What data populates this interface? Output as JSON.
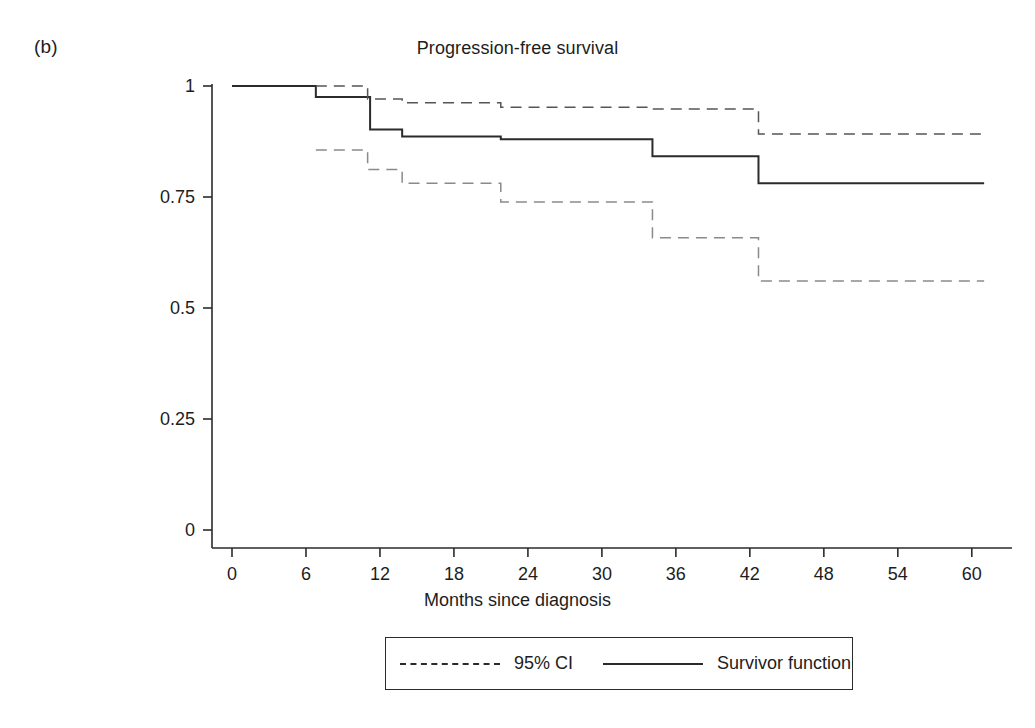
{
  "panel": {
    "label": "(b)"
  },
  "chart_data": {
    "type": "line",
    "subtype": "kaplan-meier-step",
    "title": "Progression-free survival",
    "xlabel": "Months since diagnosis",
    "ylabel": "",
    "xlim": [
      0,
      61.5
    ],
    "ylim": [
      0,
      1
    ],
    "grid": false,
    "xticks": [
      0,
      6,
      12,
      18,
      24,
      30,
      36,
      42,
      48,
      54,
      60
    ],
    "xtick_labels": [
      "0",
      "6",
      "12",
      "18",
      "24",
      "30",
      "36",
      "42",
      "48",
      "54",
      "60"
    ],
    "yticks": [
      0,
      0.25,
      0.5,
      0.75,
      1
    ],
    "ytick_labels": [
      "0",
      "0.25",
      "0.5",
      "0.75",
      "1"
    ],
    "legend": {
      "position": "below-axes",
      "entries": [
        {
          "label": "95% CI",
          "style": "dashed"
        },
        {
          "label": "Survivor function",
          "style": "solid"
        }
      ]
    },
    "series": [
      {
        "name": "Survivor function",
        "style": "solid",
        "color": "#2b2b2b",
        "x": [
          0,
          6.8,
          6.8,
          11.2,
          11.2,
          13.8,
          13.8,
          21.8,
          21.8,
          34.1,
          34.1,
          42.7,
          42.7,
          61.0
        ],
        "y": [
          1.0,
          1.0,
          0.975,
          0.975,
          0.902,
          0.902,
          0.886,
          0.886,
          0.88,
          0.88,
          0.842,
          0.842,
          0.781,
          0.781
        ]
      },
      {
        "name": "95% CI upper",
        "style": "dashed",
        "color": "#555555",
        "x": [
          6.8,
          11.0,
          11.0,
          13.8,
          13.8,
          21.8,
          21.8,
          34.1,
          34.1,
          42.7,
          42.7,
          61.0
        ],
        "y": [
          1.0,
          1.0,
          0.971,
          0.971,
          0.962,
          0.962,
          0.952,
          0.952,
          0.948,
          0.948,
          0.892,
          0.892
        ]
      },
      {
        "name": "95% CI lower",
        "style": "dashed",
        "color": "#8a8a8a",
        "x": [
          6.8,
          11.0,
          11.0,
          13.8,
          13.8,
          21.8,
          21.8,
          34.1,
          34.1,
          42.7,
          42.7,
          61.0
        ],
        "y": [
          0.856,
          0.856,
          0.812,
          0.812,
          0.781,
          0.781,
          0.739,
          0.739,
          0.658,
          0.658,
          0.561,
          0.561
        ]
      }
    ],
    "steps": [
      {
        "months": 6.8,
        "survival": 0.975
      },
      {
        "months": 11.2,
        "survival": 0.902
      },
      {
        "months": 13.8,
        "survival": 0.886
      },
      {
        "months": 21.8,
        "survival": 0.88
      },
      {
        "months": 34.1,
        "survival": 0.842
      },
      {
        "months": 42.7,
        "survival": 0.781
      }
    ]
  }
}
